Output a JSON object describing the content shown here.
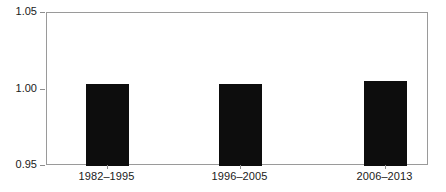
{
  "chart_data": {
    "type": "bar",
    "title": "",
    "subtitle": "",
    "xlabel": "",
    "ylabel": "",
    "categories": [
      "1982–1995",
      "1996–2005",
      "2006–2013"
    ],
    "values": [
      1.0035,
      1.0037,
      1.0053
    ],
    "ylim": [
      0.95,
      1.05
    ],
    "yticks": [
      "0.95",
      "1.00",
      "1.05"
    ],
    "ytick_values": [
      0.95,
      1.0,
      1.05
    ],
    "grid": false,
    "legend": null,
    "legend_position": "none",
    "annotations": [],
    "bar_color": "#0d0d0d",
    "frame_color": "#9a9a9a",
    "background_color": "#ffffff",
    "text_color": "#1a1a1a"
  }
}
